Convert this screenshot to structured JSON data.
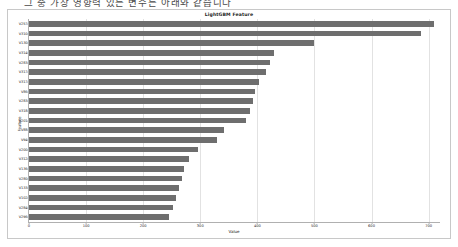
{
  "page": {
    "top_text": "그 중 가장 영향력 있는 변수는 아래와 같습니다"
  },
  "chart_data": {
    "type": "bar",
    "orientation": "horizontal",
    "title": "LightGBM Feature",
    "xlabel": "Value",
    "ylabel": "Feature",
    "xlim": [
      0,
      720
    ],
    "xticks": [
      0,
      100,
      200,
      300,
      400,
      500,
      600,
      700
    ],
    "xtick_labels": [
      "0",
      "100",
      "200",
      "300",
      "400",
      "500",
      "600",
      "700"
    ],
    "grid": true,
    "grid_axis": "x",
    "bar_color": "#6e6e6e",
    "categories": [
      "V257",
      "V310",
      "V130",
      "V314",
      "V283",
      "V317",
      "V317",
      "V86",
      "V283",
      "V318",
      "V201",
      "V88",
      "V94",
      "V200",
      "V312",
      "V136",
      "V280",
      "V133",
      "V102",
      "V284",
      "V296"
    ],
    "values": [
      710,
      686,
      500,
      430,
      422,
      415,
      403,
      396,
      392,
      388,
      380,
      342,
      330,
      296,
      280,
      272,
      268,
      262,
      258,
      252,
      245
    ]
  }
}
